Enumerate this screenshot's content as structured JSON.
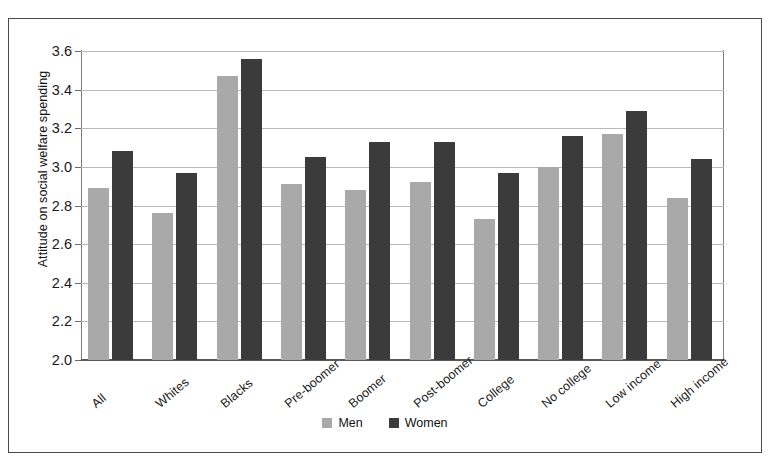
{
  "chart_data": {
    "type": "bar",
    "title": "",
    "xlabel": "",
    "ylabel": "Attitude on social welfare spending",
    "ylim": [
      2.0,
      3.6
    ],
    "ytick_step": 0.2,
    "yticks": [
      "3.6",
      "3.4",
      "3.2",
      "3.0",
      "2.8",
      "2.6",
      "2.4",
      "2.2",
      "2.0"
    ],
    "grid": "horizontal",
    "legend_position": "bottom-center",
    "categories": [
      "All",
      "Whites",
      "Blacks",
      "Pre-boomer",
      "Boomer",
      "Post-boomer",
      "College",
      "No college",
      "Low income",
      "High income"
    ],
    "series": [
      {
        "name": "Men",
        "color": "#a9a9a9",
        "values": [
          2.89,
          2.76,
          3.47,
          2.91,
          2.88,
          2.92,
          2.73,
          3.0,
          3.17,
          2.84
        ]
      },
      {
        "name": "Women",
        "color": "#3b3b3b",
        "values": [
          3.08,
          2.97,
          3.56,
          3.05,
          3.13,
          3.13,
          2.97,
          3.16,
          3.29,
          3.04
        ]
      }
    ]
  },
  "legend": {
    "items": [
      {
        "label": "Men",
        "color": "#a9a9a9"
      },
      {
        "label": "Women",
        "color": "#3b3b3b"
      }
    ]
  }
}
